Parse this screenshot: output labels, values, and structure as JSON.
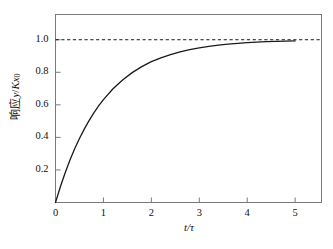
{
  "chart_data": {
    "type": "line",
    "title": "",
    "subtitle": "",
    "xlabel": "t/τ",
    "ylabel": "响应 y/Kx₀",
    "ylabel_parts": {
      "prefix": "响应",
      "var_y": "y",
      "slash": "/",
      "var_k": "K",
      "var_x": "x",
      "sub_zero": "0"
    },
    "xlabel_parts": {
      "num": "t",
      "slash": "/",
      "den": "τ"
    },
    "xlim": [
      0,
      5.55
    ],
    "ylim": [
      0,
      1.155
    ],
    "xticks": [
      0,
      1,
      2,
      3,
      4,
      5
    ],
    "xtick_labels": [
      "0",
      "1",
      "2",
      "3",
      "4",
      "5"
    ],
    "yticks": [
      0.2,
      0.4,
      0.6,
      0.8,
      1.0
    ],
    "ytick_labels": [
      "0.2",
      "0.4",
      "0.6",
      "0.8",
      "1.0"
    ],
    "grid": false,
    "legend": null,
    "legend_position": "none",
    "equation": "y/Kx0 = 1 - exp(-t/tau)",
    "series": [
      {
        "name": "step response",
        "style": "solid",
        "color": "#1a1a1a",
        "linewidth": 1.3,
        "x": [
          0,
          0.1,
          0.2,
          0.3,
          0.4,
          0.5,
          0.6,
          0.7,
          0.8,
          0.9,
          1.0,
          1.2,
          1.4,
          1.6,
          1.8,
          2.0,
          2.2,
          2.4,
          2.6,
          2.8,
          3.0,
          3.2,
          3.4,
          3.6,
          3.8,
          4.0,
          4.2,
          4.4,
          4.6,
          4.8,
          5.0
        ],
        "y": [
          0.0,
          0.095,
          0.181,
          0.259,
          0.33,
          0.393,
          0.451,
          0.503,
          0.551,
          0.593,
          0.632,
          0.699,
          0.753,
          0.798,
          0.835,
          0.865,
          0.889,
          0.909,
          0.926,
          0.939,
          0.95,
          0.959,
          0.967,
          0.973,
          0.978,
          0.982,
          0.985,
          0.988,
          0.99,
          0.992,
          0.993
        ]
      },
      {
        "name": "asymptote",
        "style": "dashed",
        "color": "#1a1a1a",
        "linewidth": 1.0,
        "x": [
          0,
          5.55
        ],
        "y": [
          1.0,
          1.0
        ]
      }
    ],
    "annotations": [],
    "frame_color": "#7a7a7a",
    "background": "#ffffff"
  }
}
